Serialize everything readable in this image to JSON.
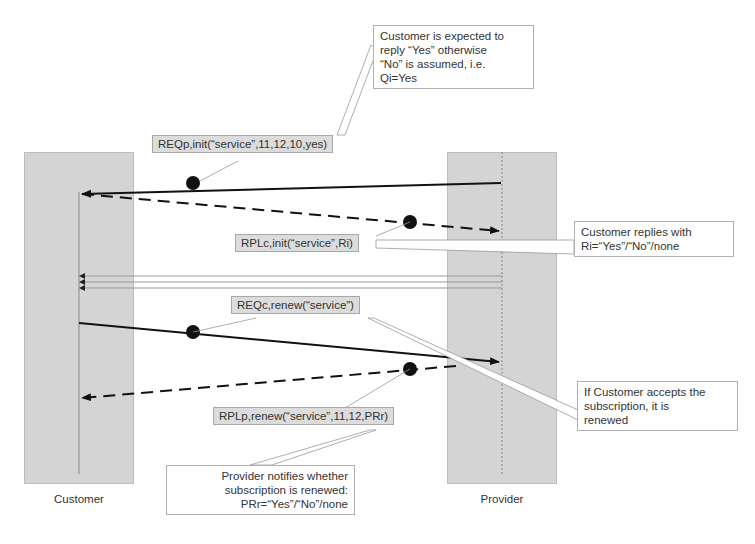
{
  "diagram": {
    "type": "sequence-diagram",
    "participants": [
      {
        "id": "customer",
        "label": "Customer"
      },
      {
        "id": "provider",
        "label": "Provider"
      }
    ],
    "messages": [
      {
        "id": "req-init",
        "label": "REQp,init(“service”,11,12,10,yes)",
        "from": "provider",
        "to": "customer",
        "style": "solid"
      },
      {
        "id": "rpl-init",
        "label": "RPLc,init(“service”,Ri)",
        "from": "customer",
        "to": "provider",
        "style": "dashed"
      },
      {
        "id": "req-renew",
        "label": "REQc,renew(“service”)",
        "from": "customer",
        "to": "provider",
        "style": "solid"
      },
      {
        "id": "rpl-renew",
        "label": "RPLp,renew(“service”,11,12,PRr)",
        "from": "provider",
        "to": "customer",
        "style": "dashed"
      }
    ],
    "notes": {
      "expected_reply": [
        "Customer is expected to",
        "reply “Yes” otherwise",
        "“No” is assumed, i.e.",
        "Qi=Yes"
      ],
      "customer_replies": [
        "Customer replies with",
        "Ri=“Yes”/“No”/none"
      ],
      "accepts_renewal": [
        "If Customer accepts the",
        "subscription, it is",
        "renewed"
      ],
      "provider_notifies": [
        "Provider notifies whether",
        "subscription is renewed:",
        "PRr=“Yes”/“No”/none"
      ]
    },
    "colors": {
      "lane_fill": "#d4d4d4",
      "label_fill": "#dcdcdc",
      "arrow": "#111111",
      "thin_line": "#9a9a9a"
    }
  }
}
